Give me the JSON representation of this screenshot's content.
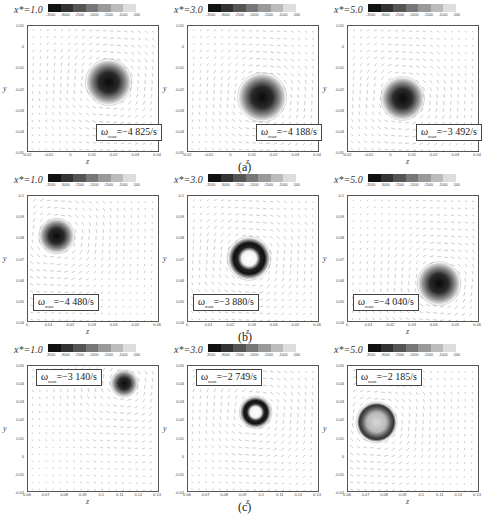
{
  "figure": {
    "rows": [
      {
        "caption": "(a)",
        "y_ticks": [
          "0.01",
          "0",
          "-0.01",
          "-0.02",
          "-0.03",
          "-0.04",
          "-0.05"
        ],
        "x_ticks": [
          "-0.02",
          "-0.01",
          "0",
          "0.01",
          "0.02",
          "0.03",
          "0.04"
        ],
        "panels": [
          {
            "x_label": "x*=1.0",
            "omega_label": "ω",
            "omega_sub": "max",
            "omega_value": "=−4 825/s",
            "vortex": {
              "cx": 0.62,
              "cy": 0.45,
              "r": 0.17,
              "type": "solid",
              "box": "br"
            }
          },
          {
            "x_label": "x*=3.0",
            "omega_label": "ω",
            "omega_sub": "max",
            "omega_value": "=−4 188/s",
            "vortex": {
              "cx": 0.57,
              "cy": 0.57,
              "r": 0.18,
              "type": "solid",
              "box": "br"
            }
          },
          {
            "x_label": "x*=5.0",
            "omega_label": "ω",
            "omega_sub": "max",
            "omega_value": "=−3 492/s",
            "vortex": {
              "cx": 0.42,
              "cy": 0.58,
              "r": 0.16,
              "type": "solid",
              "box": "br"
            }
          }
        ]
      },
      {
        "caption": "(b)",
        "y_ticks": [
          "0.1",
          "0.09",
          "0.08",
          "0.07",
          "0.06",
          "0.05",
          "0.04"
        ],
        "x_ticks": [
          "0",
          "0.01",
          "0.02",
          "0.03",
          "0.04",
          "0.05",
          "0.06"
        ],
        "panels": [
          {
            "x_label": "x*=1.0",
            "omega_label": "ω",
            "omega_sub": "max",
            "omega_value": "=−4 480/s",
            "vortex": {
              "cx": 0.22,
              "cy": 0.32,
              "r": 0.13,
              "type": "solid",
              "box": "bl"
            }
          },
          {
            "x_label": "x*=3.0",
            "omega_label": "ω",
            "omega_sub": "max",
            "omega_value": "=−3 880/s",
            "vortex": {
              "cx": 0.47,
              "cy": 0.5,
              "r": 0.16,
              "type": "ring",
              "box": "bl"
            }
          },
          {
            "x_label": "x*=5.0",
            "omega_label": "ω",
            "omega_sub": "max",
            "omega_value": "=−4 040/s",
            "vortex": {
              "cx": 0.7,
              "cy": 0.7,
              "r": 0.16,
              "type": "solid",
              "box": "bl"
            }
          }
        ]
      },
      {
        "caption": "(c)",
        "y_ticks": [
          "0.05",
          "0.04",
          "0.03",
          "0.02",
          "0.01",
          "0",
          "-0.01",
          "-0.02"
        ],
        "x_ticks": [
          "0.06",
          "0.07",
          "0.08",
          "0.09",
          "0.1",
          "0.11",
          "0.12",
          "0.13"
        ],
        "panels": [
          {
            "x_label": "x*=1.0",
            "omega_label": "ω",
            "omega_sub": "max",
            "omega_value": "=−3 140/s",
            "vortex": {
              "cx": 0.74,
              "cy": 0.14,
              "r": 0.1,
              "type": "solid",
              "box": "tl"
            }
          },
          {
            "x_label": "x*=3.0",
            "omega_label": "ω",
            "omega_sub": "max",
            "omega_value": "=−2 749/s",
            "vortex": {
              "cx": 0.52,
              "cy": 0.37,
              "r": 0.12,
              "type": "ring",
              "box": "tl"
            }
          },
          {
            "x_label": "x*=5.0",
            "omega_label": "ω",
            "omega_sub": "max",
            "omega_value": "=−2 185/s",
            "vortex": {
              "cx": 0.22,
              "cy": 0.45,
              "r": 0.15,
              "type": "light-ring",
              "box": "tl"
            }
          }
        ]
      }
    ],
    "colorbar": {
      "ticks": [
        "-3500",
        "-3000",
        "-2500",
        "-2000",
        "-1500",
        "-1000",
        "-500"
      ],
      "colors": [
        "#111111",
        "#333333",
        "#555555",
        "#777777",
        "#999999",
        "#bbbbbb",
        "#dddddd"
      ]
    },
    "axis_labels": {
      "x": "z",
      "y": "y"
    }
  }
}
